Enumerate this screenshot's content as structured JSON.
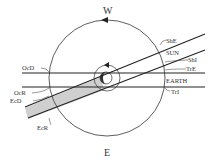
{
  "diagram": {
    "compass": {
      "top": "W",
      "bottom": "E"
    },
    "labels": {
      "ShE": "ShE",
      "SUN": "SUN",
      "ShI": "ShI",
      "TrE": "TrE",
      "EARTH": "EARTH",
      "TrI": "TrI",
      "OcD": "OcD",
      "OcR": "OcR",
      "EcD": "EcD",
      "EcR": "EcR"
    },
    "colors": {
      "line": "#222222",
      "shadow": "#cfcfcf",
      "planet_dark": "#333333"
    }
  }
}
